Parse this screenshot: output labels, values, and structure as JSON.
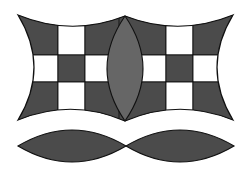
{
  "title": "Curved quilt-block geometric figure",
  "colors": {
    "background": "#ffffff",
    "dark_fill": "#4b4b4b",
    "lens_fill": "#666666",
    "light_cell": "#ffffff",
    "outline": "#111111"
  },
  "shapes": {
    "upper_block": {
      "description": "Concave-edged block containing two 3x3 checkerboards separated by a vertical lens",
      "tips": {
        "top_left": [
          18,
          15
        ],
        "top_center": [
          125,
          16
        ],
        "top_right": [
          233,
          15
        ],
        "bottom_left": [
          18,
          120
        ],
        "bottom_center": [
          125,
          121
        ],
        "bottom_right": [
          233,
          120
        ]
      },
      "left_grid": {
        "columns_x": [
          31,
          58,
          85,
          112
        ],
        "rows_y": [
          28,
          55,
          82,
          109
        ],
        "pattern": [
          [
            "dark",
            "light",
            "dark"
          ],
          [
            "light",
            "dark",
            "light"
          ],
          [
            "dark",
            "light",
            "dark"
          ]
        ]
      },
      "right_grid": {
        "columns_x": [
          139,
          166,
          193,
          220
        ],
        "rows_y": [
          28,
          55,
          82,
          109
        ],
        "pattern": [
          [
            "dark",
            "light",
            "dark"
          ],
          [
            "light",
            "dark",
            "light"
          ],
          [
            "dark",
            "light",
            "dark"
          ]
        ]
      },
      "center_lens": {
        "top": [
          125,
          16
        ],
        "bottom": [
          125,
          121
        ],
        "max_half_width": 18
      }
    },
    "lower_lenses": [
      {
        "left_tip": [
          18,
          146
        ],
        "right_tip": [
          126,
          146
        ],
        "half_height": 16
      },
      {
        "left_tip": [
          126,
          146
        ],
        "right_tip": [
          234,
          146
        ],
        "half_height": 16
      }
    ]
  }
}
